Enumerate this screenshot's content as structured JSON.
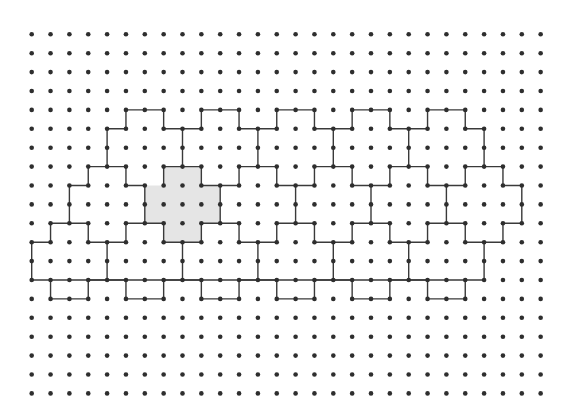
{
  "diagram": {
    "type": "dot-grid-tiling",
    "grid": {
      "columns": 28,
      "rows": 20,
      "origin_x": 31.7,
      "origin_y": 34.3,
      "spacing_x": 18.85,
      "spacing_y": 18.9,
      "dot_radius": 2.3
    },
    "colors": {
      "background": "#ffffff",
      "dot": "#2e2e2e",
      "line": "#3a3a3a",
      "shaded_tile": "#e5e5e5"
    },
    "shaded_tile": {
      "shape": "plus",
      "vertices": [
        [
          7,
          7
        ],
        [
          9,
          7
        ],
        [
          9,
          8
        ],
        [
          10,
          8
        ],
        [
          10,
          10
        ],
        [
          9,
          10
        ],
        [
          9,
          11
        ],
        [
          7,
          11
        ],
        [
          7,
          10
        ],
        [
          6,
          10
        ],
        [
          6,
          8
        ],
        [
          7,
          8
        ]
      ]
    },
    "outline": {
      "vertices": [
        [
          5,
          4
        ],
        [
          7,
          4
        ],
        [
          7,
          5
        ],
        [
          9,
          5
        ],
        [
          9,
          4
        ],
        [
          11,
          4
        ],
        [
          11,
          5
        ],
        [
          13,
          5
        ],
        [
          13,
          4
        ],
        [
          15,
          4
        ],
        [
          15,
          5
        ],
        [
          17,
          5
        ],
        [
          17,
          4
        ],
        [
          19,
          4
        ],
        [
          19,
          5
        ],
        [
          21,
          5
        ],
        [
          21,
          4
        ],
        [
          23,
          4
        ],
        [
          23,
          5
        ],
        [
          24,
          5
        ],
        [
          24,
          7
        ],
        [
          25,
          7
        ],
        [
          25,
          8
        ],
        [
          26,
          8
        ],
        [
          26,
          10
        ],
        [
          25,
          10
        ],
        [
          25,
          11
        ],
        [
          24,
          11
        ],
        [
          24,
          13
        ],
        [
          23,
          13
        ],
        [
          23,
          14
        ],
        [
          21,
          14
        ],
        [
          21,
          13
        ],
        [
          19,
          13
        ],
        [
          19,
          14
        ],
        [
          17,
          14
        ],
        [
          17,
          13
        ],
        [
          15,
          13
        ],
        [
          15,
          14
        ],
        [
          13,
          14
        ],
        [
          13,
          13
        ],
        [
          11,
          13
        ],
        [
          11,
          14
        ],
        [
          9,
          14
        ],
        [
          9,
          13
        ],
        [
          7,
          13
        ],
        [
          7,
          14
        ],
        [
          5,
          14
        ],
        [
          5,
          13
        ],
        [
          3,
          13
        ],
        [
          3,
          14
        ],
        [
          1,
          14
        ],
        [
          1,
          13
        ],
        [
          0,
          13
        ],
        [
          0,
          11
        ],
        [
          1,
          11
        ],
        [
          1,
          10
        ],
        [
          2,
          10
        ],
        [
          2,
          8
        ],
        [
          3,
          8
        ],
        [
          3,
          7
        ],
        [
          4,
          7
        ],
        [
          4,
          5
        ],
        [
          5,
          5
        ]
      ]
    },
    "interior_segments": [
      [
        [
          8,
          5
        ],
        [
          8,
          7
        ]
      ],
      [
        [
          12,
          5
        ],
        [
          12,
          7
        ]
      ],
      [
        [
          16,
          5
        ],
        [
          16,
          7
        ]
      ],
      [
        [
          20,
          5
        ],
        [
          20,
          7
        ]
      ],
      [
        [
          4,
          7
        ],
        [
          5,
          7
        ]
      ],
      [
        [
          5,
          7
        ],
        [
          5,
          8
        ]
      ],
      [
        [
          5,
          8
        ],
        [
          6,
          8
        ]
      ],
      [
        [
          7,
          7
        ],
        [
          7,
          8
        ]
      ],
      [
        [
          7,
          7
        ],
        [
          9,
          7
        ]
      ],
      [
        [
          9,
          7
        ],
        [
          9,
          8
        ]
      ],
      [
        [
          9,
          8
        ],
        [
          11,
          8
        ]
      ],
      [
        [
          11,
          7
        ],
        [
          11,
          8
        ]
      ],
      [
        [
          11,
          7
        ],
        [
          13,
          7
        ]
      ],
      [
        [
          13,
          7
        ],
        [
          13,
          8
        ]
      ],
      [
        [
          13,
          8
        ],
        [
          15,
          8
        ]
      ],
      [
        [
          15,
          7
        ],
        [
          15,
          8
        ]
      ],
      [
        [
          15,
          7
        ],
        [
          17,
          7
        ]
      ],
      [
        [
          17,
          7
        ],
        [
          17,
          8
        ]
      ],
      [
        [
          17,
          8
        ],
        [
          19,
          8
        ]
      ],
      [
        [
          19,
          7
        ],
        [
          19,
          8
        ]
      ],
      [
        [
          19,
          7
        ],
        [
          21,
          7
        ]
      ],
      [
        [
          21,
          7
        ],
        [
          21,
          8
        ]
      ],
      [
        [
          21,
          8
        ],
        [
          23,
          8
        ]
      ],
      [
        [
          23,
          7
        ],
        [
          23,
          8
        ]
      ],
      [
        [
          23,
          7
        ],
        [
          24,
          7
        ]
      ],
      [
        [
          6,
          8
        ],
        [
          6,
          10
        ]
      ],
      [
        [
          10,
          8
        ],
        [
          10,
          10
        ]
      ],
      [
        [
          14,
          8
        ],
        [
          14,
          10
        ]
      ],
      [
        [
          18,
          8
        ],
        [
          18,
          10
        ]
      ],
      [
        [
          22,
          8
        ],
        [
          22,
          10
        ]
      ],
      [
        [
          2,
          10
        ],
        [
          3,
          10
        ]
      ],
      [
        [
          3,
          10
        ],
        [
          3,
          11
        ]
      ],
      [
        [
          3,
          11
        ],
        [
          5,
          11
        ]
      ],
      [
        [
          5,
          10
        ],
        [
          5,
          11
        ]
      ],
      [
        [
          5,
          10
        ],
        [
          7,
          10
        ]
      ],
      [
        [
          7,
          10
        ],
        [
          7,
          11
        ]
      ],
      [
        [
          7,
          11
        ],
        [
          9,
          11
        ]
      ],
      [
        [
          9,
          10
        ],
        [
          9,
          11
        ]
      ],
      [
        [
          9,
          10
        ],
        [
          11,
          10
        ]
      ],
      [
        [
          11,
          10
        ],
        [
          11,
          11
        ]
      ],
      [
        [
          11,
          11
        ],
        [
          13,
          11
        ]
      ],
      [
        [
          13,
          10
        ],
        [
          13,
          11
        ]
      ],
      [
        [
          13,
          10
        ],
        [
          15,
          10
        ]
      ],
      [
        [
          15,
          10
        ],
        [
          15,
          11
        ]
      ],
      [
        [
          15,
          11
        ],
        [
          17,
          11
        ]
      ],
      [
        [
          17,
          10
        ],
        [
          17,
          11
        ]
      ],
      [
        [
          17,
          10
        ],
        [
          19,
          10
        ]
      ],
      [
        [
          19,
          10
        ],
        [
          19,
          11
        ]
      ],
      [
        [
          19,
          11
        ],
        [
          21,
          11
        ]
      ],
      [
        [
          21,
          10
        ],
        [
          21,
          11
        ]
      ],
      [
        [
          21,
          10
        ],
        [
          23,
          10
        ]
      ],
      [
        [
          23,
          10
        ],
        [
          23,
          11
        ]
      ],
      [
        [
          23,
          11
        ],
        [
          24,
          11
        ]
      ],
      [
        [
          4,
          11
        ],
        [
          4,
          13
        ]
      ],
      [
        [
          8,
          11
        ],
        [
          8,
          13
        ]
      ],
      [
        [
          12,
          11
        ],
        [
          12,
          13
        ]
      ],
      [
        [
          16,
          11
        ],
        [
          16,
          13
        ]
      ],
      [
        [
          20,
          11
        ],
        [
          20,
          13
        ]
      ],
      [
        [
          1,
          13
        ],
        [
          3,
          13
        ]
      ],
      [
        [
          3,
          13
        ],
        [
          5,
          13
        ]
      ],
      [
        [
          5,
          13
        ],
        [
          7,
          13
        ]
      ],
      [
        [
          7,
          13
        ],
        [
          9,
          13
        ]
      ],
      [
        [
          9,
          13
        ],
        [
          11,
          13
        ]
      ],
      [
        [
          11,
          13
        ],
        [
          13,
          13
        ]
      ],
      [
        [
          13,
          13
        ],
        [
          15,
          13
        ]
      ],
      [
        [
          15,
          13
        ],
        [
          17,
          13
        ]
      ],
      [
        [
          17,
          13
        ],
        [
          19,
          13
        ]
      ],
      [
        [
          19,
          13
        ],
        [
          21,
          13
        ]
      ],
      [
        [
          21,
          13
        ],
        [
          23,
          13
        ]
      ]
    ]
  }
}
